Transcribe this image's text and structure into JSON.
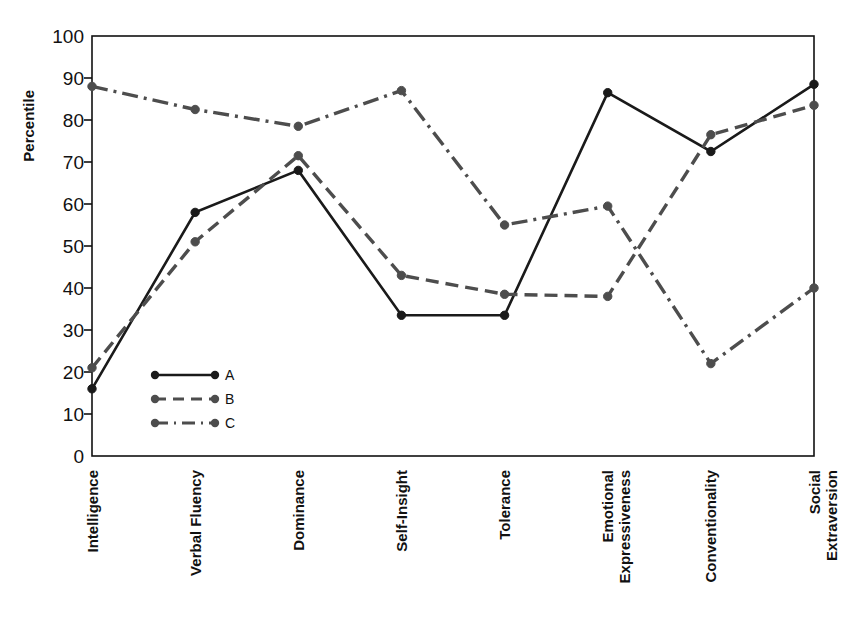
{
  "chart_data": {
    "type": "line",
    "title": "",
    "xlabel": "",
    "ylabel": "Percentile",
    "ylim": [
      0,
      100
    ],
    "ytick_step": 10,
    "yticks": [
      "0",
      "10",
      "20",
      "30",
      "40",
      "50",
      "60",
      "70",
      "80",
      "90",
      "100"
    ],
    "grid": false,
    "legend_position": "inside-lower-left",
    "categories": [
      "Intelligence",
      "Verbal Fluency",
      "Dominance",
      "Self-Insight",
      "Tolerance",
      "Emotional Expressiveness",
      "Conventionality",
      "Social Extraversion"
    ],
    "series": [
      {
        "name": "A",
        "style": "solid",
        "color": "#1a1a1a",
        "values": [
          16,
          58,
          68,
          33.5,
          33.5,
          86.5,
          72.5,
          88.5
        ]
      },
      {
        "name": "B",
        "style": "dashed",
        "color": "#4d4d4d",
        "values": [
          21,
          51,
          71.5,
          43,
          38.5,
          38,
          76.5,
          83.5
        ]
      },
      {
        "name": "C",
        "style": "dashdot",
        "color": "#4d4d4d",
        "values": [
          88,
          82.5,
          78.5,
          87,
          55,
          59.5,
          22,
          40
        ]
      }
    ]
  },
  "legend": {
    "entries": [
      {
        "label": "A"
      },
      {
        "label": "B"
      },
      {
        "label": "C"
      }
    ]
  }
}
